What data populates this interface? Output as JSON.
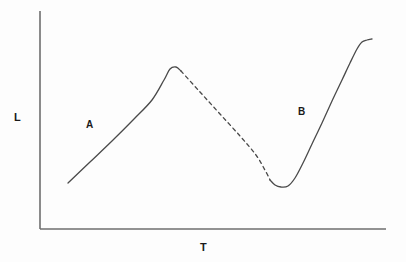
{
  "figure": {
    "background_color": "#fdfdfd",
    "width": 406,
    "height": 262
  },
  "axes": {
    "y_axis_label": "L",
    "x_axis_label": "T",
    "axis_color": "#6e6e6e",
    "y_axis": {
      "x": 40,
      "y_top": 11,
      "y_bottom": 229
    },
    "x_axis": {
      "y": 229,
      "x_left": 40,
      "x_right": 386
    },
    "ticks": [],
    "tick_labels": [],
    "grid": false
  },
  "annotations": [
    {
      "text": "A",
      "x": 91,
      "y": 125
    },
    {
      "text": "B",
      "x": 303,
      "y": 112
    }
  ],
  "curve": {
    "color": "#4a4a4a",
    "line_width": 1.3,
    "solid_segments": [
      "rising-limb-A",
      "valley-to-plateau-B"
    ],
    "dashed_segment": "declining-limb",
    "dash_pattern": "3.5 3.5"
  },
  "chart_data": {
    "type": "line",
    "title": "",
    "xlabel": "T",
    "ylabel": "L",
    "grid": false,
    "legend": "none",
    "xlim": [
      40,
      386
    ],
    "ylim": [
      229,
      11
    ],
    "axis_ticks_shown": false,
    "series": [
      {
        "name": "A",
        "style": "solid",
        "label": "A",
        "points": [
          [
            68,
            183
          ],
          [
            90,
            162
          ],
          [
            112,
            141
          ],
          [
            134,
            119
          ],
          [
            152,
            100
          ],
          [
            164,
            80
          ],
          [
            170,
            69
          ],
          [
            176,
            67
          ],
          [
            181,
            71
          ]
        ]
      },
      {
        "name": "declining-limb",
        "style": "dashed",
        "label": "",
        "points": [
          [
            181,
            71
          ],
          [
            200,
            92
          ],
          [
            220,
            114
          ],
          [
            240,
            136
          ],
          [
            256,
            155
          ],
          [
            266,
            172
          ],
          [
            270,
            180
          ]
        ]
      },
      {
        "name": "B",
        "style": "solid",
        "label": "B",
        "points": [
          [
            270,
            180
          ],
          [
            275,
            185
          ],
          [
            281,
            187
          ],
          [
            288,
            186
          ],
          [
            295,
            178
          ],
          [
            303,
            163
          ],
          [
            312,
            144
          ],
          [
            322,
            123
          ],
          [
            332,
            101
          ],
          [
            342,
            80
          ],
          [
            350,
            63
          ],
          [
            357,
            49
          ],
          [
            362,
            42
          ],
          [
            367,
            40
          ],
          [
            372,
            39
          ]
        ]
      }
    ]
  }
}
